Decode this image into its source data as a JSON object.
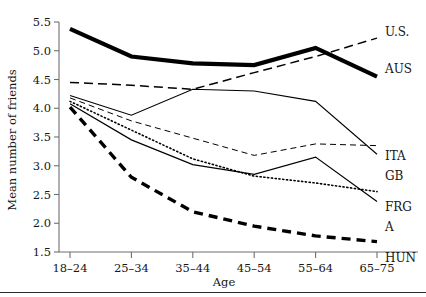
{
  "chart_data": {
    "type": "line",
    "title": "",
    "xlabel": "Age",
    "ylabel": "Mean number of friends",
    "categories": [
      "18–24",
      "25–34",
      "35–44",
      "45–54",
      "55–64",
      "65–75"
    ],
    "ylim": [
      1.5,
      5.5
    ],
    "yticks": [
      1.5,
      2.0,
      2.5,
      3.0,
      3.5,
      4.0,
      4.5,
      5.0,
      5.5
    ],
    "ytick_labels": [
      "1.5",
      "2.0",
      "2.5",
      "3.0",
      "3.5",
      "4.0",
      "4.5",
      "5.0",
      "5.5"
    ],
    "grid": false,
    "legend_position": "right-of-axes (line-end labels)",
    "series": [
      {
        "name": "AUS",
        "label": "AUS",
        "style": "solid-thick",
        "color": "#000000",
        "width": 4.2,
        "dash": "none",
        "values": [
          5.38,
          4.9,
          4.78,
          4.75,
          5.05,
          4.55
        ]
      },
      {
        "name": "U.S.",
        "label": "U.S.",
        "style": "dashed",
        "color": "#000000",
        "width": 1.5,
        "dash": "9,5",
        "values": [
          4.45,
          4.4,
          4.33,
          4.62,
          4.9,
          5.22
        ]
      },
      {
        "name": "ITA",
        "label": "ITA",
        "style": "solid-thin",
        "color": "#000000",
        "width": 1.1,
        "dash": "none",
        "values": [
          4.22,
          3.88,
          4.33,
          4.3,
          4.12,
          3.2
        ]
      },
      {
        "name": "GB",
        "label": "GB",
        "style": "dashed-thin",
        "color": "#000000",
        "width": 1.0,
        "dash": "6,4",
        "values": [
          4.18,
          3.78,
          3.48,
          3.18,
          3.38,
          3.35
        ]
      },
      {
        "name": "FRG",
        "label": "FRG",
        "style": "dotted",
        "color": "#000000",
        "width": 1.6,
        "dash": "1.2,2.6",
        "values": [
          4.12,
          3.62,
          3.12,
          2.82,
          2.7,
          2.55
        ]
      },
      {
        "name": "A",
        "label": "A",
        "style": "solid-thin",
        "color": "#000000",
        "width": 1.2,
        "dash": "none",
        "values": [
          4.08,
          3.45,
          3.02,
          2.85,
          3.15,
          2.38
        ]
      },
      {
        "name": "HUN",
        "label": "HUN",
        "style": "dashed-thick",
        "color": "#000000",
        "width": 3.4,
        "dash": "9,6",
        "values": [
          4.02,
          2.8,
          2.2,
          1.95,
          1.78,
          1.68
        ]
      }
    ]
  }
}
